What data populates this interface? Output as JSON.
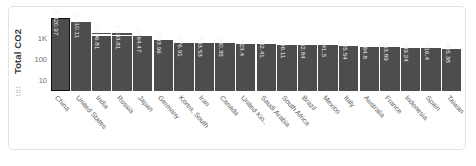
{
  "widget": {
    "drag_handle_glyph": "⣿"
  },
  "chart_data": {
    "type": "bar",
    "title": "",
    "xlabel": "",
    "ylabel": "Total CO2",
    "yscale": "log",
    "ytick_labels": [
      "1K",
      "100",
      "10"
    ],
    "grid": false,
    "legend": "none",
    "selected_category": "China",
    "categories": [
      "China",
      "United States",
      "India",
      "Russia",
      "Japan",
      "Germany",
      "Korea, South",
      "Iran",
      "Canada",
      "United Kin..",
      "Saudi Arabia",
      "South Africa",
      "Brazil",
      "Mexico",
      "Italy",
      "Australia",
      "France",
      "Indonesia",
      "Spain",
      "Taiwan"
    ],
    "values": [
      8320.97,
      5610.11,
      1696.81,
      1633.81,
      1164.47,
      793.96,
      576.91,
      543.53,
      540.35,
      523.4,
      482.41,
      466.11,
      452.84,
      441.5,
      405.54,
      384.8,
      363.89,
      339.24,
      316.4,
      305.38
    ],
    "value_labels": [
      "8,320.97",
      "5,610.11",
      "1,696.81",
      "1,633.81",
      "1,164.47",
      "793.96",
      "576.91",
      "543.53",
      "540.35",
      "523.4",
      "482.41",
      "466.11",
      "452.84",
      "441.5",
      "405.54",
      "384.8",
      "363.89",
      "339.24",
      "316.4",
      "305.38"
    ]
  }
}
